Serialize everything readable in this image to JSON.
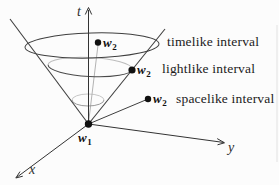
{
  "colors": {
    "background": "#fcfcfc",
    "ink": "#2e2e2e",
    "hidden_line": "#bdbdbd",
    "text": "#1b1b1b"
  },
  "axes": {
    "t_label": "t",
    "x_label": "x",
    "y_label": "y"
  },
  "origin_point": {
    "base": "w",
    "sub": "1"
  },
  "events": [
    {
      "id": "timelike",
      "point_base": "w",
      "point_sub": "2",
      "interval_label": "timelike interval"
    },
    {
      "id": "lightlike",
      "point_base": "w",
      "point_sub": "2",
      "interval_label": "lightlike interval"
    },
    {
      "id": "spacelike",
      "point_base": "w",
      "point_sub": "2",
      "interval_label": "spacelike interval"
    }
  ]
}
